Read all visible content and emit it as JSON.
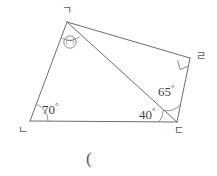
{
  "figure": {
    "caption": "(",
    "stroke_color": "#6d6d6d",
    "arc_color": "#8a8a8a",
    "background": "#ffffff",
    "vertices": [
      {
        "id": "g",
        "label": "ㄱ",
        "x": 67,
        "y": 22
      },
      {
        "id": "n",
        "label": "ㄴ",
        "x": 30,
        "y": 121
      },
      {
        "id": "d",
        "label": "ㄷ",
        "x": 177,
        "y": 122
      },
      {
        "id": "r",
        "label": "ㄹ",
        "x": 190,
        "y": 58
      }
    ],
    "vertex_labels": {
      "top": "ㄱ",
      "bottom_left": "ㄴ",
      "bottom_right": "ㄷ",
      "right": "ㄹ"
    },
    "angles": [
      {
        "id": "unknown-top",
        "vertex": "ㄱ",
        "label": "㈠",
        "type": "marker"
      },
      {
        "id": "angle-bottom-left",
        "vertex": "ㄴ",
        "value": "70",
        "unit": "°"
      },
      {
        "id": "angle-bottom-right-lower",
        "vertex": "ㄷ",
        "value": "40",
        "unit": "°"
      },
      {
        "id": "angle-bottom-right-upper",
        "vertex": "ㄷ",
        "value": "65",
        "unit": "°"
      },
      {
        "id": "angle-right",
        "vertex": "ㄹ",
        "value": "90",
        "unit": "°",
        "type": "right-angle-mark"
      }
    ],
    "labels": {
      "unknown_marker": "㈠",
      "angle_70": "70",
      "angle_40": "40",
      "angle_65": "65",
      "degree": "°"
    }
  }
}
